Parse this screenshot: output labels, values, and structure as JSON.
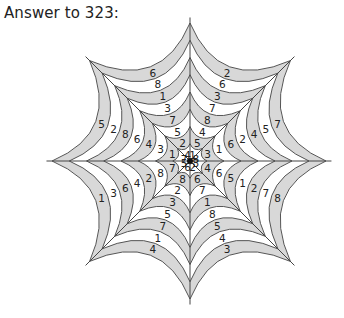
{
  "title": "Answer to 323:",
  "web": {
    "center": [
      190,
      161
    ],
    "rings": 8,
    "spokes": 8,
    "shade_color": "#d8d8d8",
    "line_color": "#555555",
    "sectors": [
      {
        "name": "NNW",
        "inner_to_outer": [
          1,
          5,
          4,
          8,
          7,
          3,
          6,
          2
        ]
      },
      {
        "name": "NNE",
        "inner_to_outer": [
          8,
          3,
          1,
          6,
          2,
          4,
          5,
          7
        ]
      },
      {
        "name": "ENE",
        "inner_to_outer": [
          3,
          4,
          6,
          5,
          1,
          2,
          7,
          8
        ]
      },
      {
        "name": "ESE",
        "inner_to_outer": [
          2,
          6,
          7,
          1,
          8,
          5,
          4,
          3
        ]
      },
      {
        "name": "SSE",
        "inner_to_outer": [
          6,
          8,
          2,
          3,
          5,
          7,
          1,
          4
        ]
      },
      {
        "name": "SSW",
        "inner_to_outer": [
          5,
          7,
          8,
          2,
          4,
          6,
          3,
          1
        ]
      },
      {
        "name": "WSW",
        "inner_to_outer": [
          7,
          1,
          3,
          4,
          6,
          8,
          2,
          5
        ]
      },
      {
        "name": "WNW",
        "inner_to_outer": [
          4,
          2,
          5,
          7,
          3,
          1,
          8,
          6
        ]
      }
    ]
  }
}
